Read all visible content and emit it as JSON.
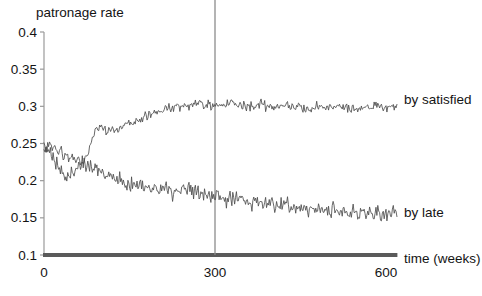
{
  "chart_data": {
    "type": "line",
    "title": "patronage rate",
    "xlabel": "time (weeks)",
    "ylabel": "patronage rate",
    "xlim": [
      0,
      620
    ],
    "ylim": [
      0.1,
      0.4
    ],
    "grid": false,
    "legend_position": "right-inline",
    "xticks": [
      "0",
      "300",
      "600"
    ],
    "xtick_values": [
      0,
      300,
      600
    ],
    "yticks": [
      "0.1",
      "0.15",
      "0.2",
      "0.25",
      "0.3",
      "0.35",
      "0.4"
    ],
    "ytick_values": [
      0.1,
      0.15,
      0.2,
      0.25,
      0.3,
      0.35,
      0.4
    ],
    "annotations": [
      {
        "name": "reference-line",
        "type": "vline",
        "x": 300
      }
    ],
    "series": [
      {
        "name": "by satisfied",
        "label": "by satisfied",
        "color": "#4d4d4d",
        "x": [
          0,
          5,
          10,
          15,
          20,
          25,
          30,
          35,
          40,
          45,
          50,
          55,
          60,
          65,
          70,
          75,
          80,
          85,
          90,
          95,
          100,
          110,
          120,
          130,
          140,
          150,
          160,
          170,
          180,
          190,
          200,
          210,
          220,
          230,
          240,
          250,
          260,
          270,
          280,
          290,
          300,
          310,
          320,
          330,
          340,
          350,
          360,
          370,
          380,
          390,
          400,
          410,
          420,
          430,
          440,
          450,
          460,
          470,
          480,
          490,
          500,
          510,
          520,
          530,
          540,
          550,
          560,
          570,
          580,
          590,
          600,
          610,
          620
        ],
        "values": [
          0.248,
          0.244,
          0.252,
          0.241,
          0.247,
          0.238,
          0.243,
          0.232,
          0.237,
          0.228,
          0.233,
          0.225,
          0.23,
          0.222,
          0.227,
          0.234,
          0.246,
          0.258,
          0.266,
          0.27,
          0.272,
          0.268,
          0.271,
          0.269,
          0.273,
          0.277,
          0.28,
          0.284,
          0.287,
          0.29,
          0.292,
          0.295,
          0.297,
          0.299,
          0.3,
          0.301,
          0.302,
          0.303,
          0.302,
          0.301,
          0.3,
          0.301,
          0.302,
          0.303,
          0.302,
          0.301,
          0.3,
          0.301,
          0.302,
          0.301,
          0.3,
          0.299,
          0.3,
          0.301,
          0.3,
          0.299,
          0.298,
          0.299,
          0.3,
          0.299,
          0.298,
          0.299,
          0.3,
          0.299,
          0.298,
          0.297,
          0.298,
          0.299,
          0.3,
          0.299,
          0.298,
          0.299,
          0.3
        ]
      },
      {
        "name": "by late",
        "label": "by late",
        "color": "#4d4d4d",
        "x": [
          0,
          5,
          10,
          15,
          20,
          25,
          30,
          35,
          40,
          45,
          50,
          55,
          60,
          65,
          70,
          75,
          80,
          85,
          90,
          95,
          100,
          110,
          120,
          130,
          140,
          150,
          160,
          170,
          180,
          190,
          200,
          210,
          220,
          230,
          240,
          250,
          260,
          270,
          280,
          290,
          300,
          310,
          320,
          330,
          340,
          350,
          360,
          370,
          380,
          390,
          400,
          410,
          420,
          430,
          440,
          450,
          460,
          470,
          480,
          490,
          500,
          510,
          520,
          530,
          540,
          550,
          560,
          570,
          580,
          590,
          600,
          610,
          620
        ],
        "values": [
          0.25,
          0.243,
          0.236,
          0.229,
          0.222,
          0.216,
          0.211,
          0.207,
          0.205,
          0.207,
          0.211,
          0.216,
          0.221,
          0.225,
          0.226,
          0.224,
          0.221,
          0.218,
          0.215,
          0.213,
          0.211,
          0.207,
          0.204,
          0.201,
          0.199,
          0.197,
          0.195,
          0.193,
          0.191,
          0.19,
          0.189,
          0.188,
          0.187,
          0.186,
          0.185,
          0.184,
          0.183,
          0.182,
          0.181,
          0.18,
          0.179,
          0.178,
          0.177,
          0.176,
          0.175,
          0.174,
          0.173,
          0.172,
          0.171,
          0.17,
          0.169,
          0.168,
          0.167,
          0.166,
          0.165,
          0.164,
          0.163,
          0.163,
          0.162,
          0.161,
          0.16,
          0.159,
          0.159,
          0.158,
          0.158,
          0.157,
          0.157,
          0.156,
          0.156,
          0.155,
          0.155,
          0.155,
          0.155
        ]
      }
    ]
  },
  "axis": {
    "baseline_color": "#5a5a5a",
    "axis_color": "#9a9a9a",
    "reference_line_color": "#8c8c8c"
  }
}
